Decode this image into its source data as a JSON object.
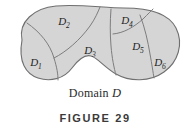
{
  "figure": {
    "caption": "Domain",
    "caption_symbol": "D",
    "caption_full": "Domain D",
    "figure_number": "FIGURE 29",
    "shape_name": "kidney-shaped-domain",
    "fill_color": "#d5d5d5",
    "stroke_color": "#6f6f6f",
    "inner_stroke_color": "#7d7d7d",
    "background_color": "#ffffff",
    "text_color": "#1d1d1d"
  },
  "regions": [
    {
      "id": "D1",
      "base": "D",
      "subscript": "1",
      "label": "D₁",
      "x": 36,
      "y": 66
    },
    {
      "id": "D2",
      "base": "D",
      "subscript": "2",
      "label": "D₂",
      "x": 64,
      "y": 25
    },
    {
      "id": "D3",
      "base": "D",
      "subscript": "3",
      "label": "D₃",
      "x": 90,
      "y": 54
    },
    {
      "id": "D4",
      "base": "D",
      "subscript": "4",
      "label": "D₄",
      "x": 127,
      "y": 24
    },
    {
      "id": "D5",
      "base": "D",
      "subscript": "5",
      "label": "D₅",
      "x": 138,
      "y": 50
    },
    {
      "id": "D6",
      "base": "D",
      "subscript": "6",
      "label": "D₆",
      "x": 160,
      "y": 66
    }
  ]
}
